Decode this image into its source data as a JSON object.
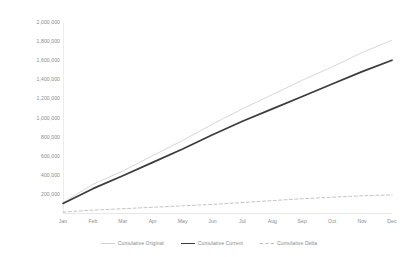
{
  "chart_data": {
    "type": "line",
    "title": "",
    "xlabel": "",
    "ylabel": "",
    "categories": [
      "Jan",
      "Feb",
      "Mar",
      "Apr",
      "May",
      "Jun",
      "Jul",
      "Aug",
      "Sep",
      "Oct",
      "Nov",
      "Dec"
    ],
    "ylim": [
      0,
      2000000
    ],
    "xlim": [
      0,
      11
    ],
    "grid": false,
    "legend_position": "bottom-center",
    "y_ticks": [
      {
        "value": 2000000,
        "label": "2,000,000"
      },
      {
        "value": 1800000,
        "label": "1,800,000"
      },
      {
        "value": 1600000,
        "label": "1,600,000"
      },
      {
        "value": 1400000,
        "label": "1,400,000"
      },
      {
        "value": 1200000,
        "label": "1,200,000"
      },
      {
        "value": 1000000,
        "label": "1,000,000"
      },
      {
        "value": 800000,
        "label": "800,000"
      },
      {
        "value": 600000,
        "label": "600,000"
      },
      {
        "value": 400000,
        "label": "400,000"
      },
      {
        "value": 200000,
        "label": "200,000"
      }
    ],
    "series": [
      {
        "name": "Cumulative Original",
        "color": "#d2d2d2",
        "width": 0.9,
        "dash": "none",
        "values": [
          110000,
          300000,
          440000,
          600000,
          760000,
          930000,
          1090000,
          1240000,
          1390000,
          1530000,
          1680000,
          1810000
        ]
      },
      {
        "name": "Cumulative Current",
        "color": "#3b3b3b",
        "width": 1.7,
        "dash": "none",
        "values": [
          100000,
          255000,
          390000,
          530000,
          670000,
          820000,
          960000,
          1090000,
          1220000,
          1350000,
          1480000,
          1600000
        ]
      },
      {
        "name": "Cumulative Delta",
        "color": "#bcbcbc",
        "width": 0.9,
        "dash": "3,2.4",
        "values": [
          10000,
          30000,
          45000,
          60000,
          75000,
          90000,
          110000,
          130000,
          150000,
          165000,
          180000,
          190000
        ]
      }
    ]
  },
  "legend": {
    "items": [
      {
        "label": "Cumulative Original"
      },
      {
        "label": "Cumulative Current"
      },
      {
        "label": "Cumulative Delta"
      }
    ]
  }
}
